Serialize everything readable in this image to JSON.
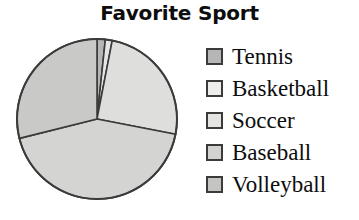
{
  "chart_data": {
    "type": "pie",
    "title": "Favorite Sport",
    "xlabel": "",
    "ylabel": "",
    "legend_position": "right",
    "grid": false,
    "start_angle_deg": 0,
    "direction": "clockwise",
    "categories": [
      "Tennis",
      "Basketball",
      "Soccer",
      "Baseball",
      "Volleyball"
    ],
    "values": [
      1.7,
      1.4,
      25.0,
      43.0,
      28.9
    ],
    "units": "percent",
    "slices": [
      {
        "label": "Tennis",
        "percent": 1.7,
        "angle_deg": 6,
        "start_deg": 0,
        "end_deg": 6,
        "color": "#b6b6b6"
      },
      {
        "label": "Basketball",
        "percent": 1.4,
        "angle_deg": 5,
        "start_deg": 6,
        "end_deg": 11,
        "color": "#e6e6e6"
      },
      {
        "label": "Soccer",
        "percent": 25.0,
        "angle_deg": 90,
        "start_deg": 11,
        "end_deg": 101,
        "color": "#dededc"
      },
      {
        "label": "Baseball",
        "percent": 43.0,
        "angle_deg": 155,
        "start_deg": 101,
        "end_deg": 256,
        "color": "#d4d4d2"
      },
      {
        "label": "Volleyball",
        "percent": 28.9,
        "angle_deg": 104,
        "start_deg": 256,
        "end_deg": 360,
        "color": "#c9c9c7"
      }
    ],
    "outline_color": "#3b3b3b"
  },
  "legend": {
    "items": [
      {
        "label": "Tennis",
        "swatch_color": "#b6b6b6"
      },
      {
        "label": "Basketball",
        "swatch_color": "#ededeb"
      },
      {
        "label": "Soccer",
        "swatch_color": "#e4e4e2"
      },
      {
        "label": "Baseball",
        "swatch_color": "#d2d2d0"
      },
      {
        "label": "Volleyball",
        "swatch_color": "#c4c4c2"
      }
    ]
  }
}
